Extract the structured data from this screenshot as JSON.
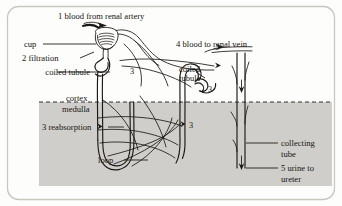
{
  "figure": {
    "frame_color": "#c9c7c2",
    "background_color": "#fdfdfc",
    "medulla_color": "#cfcecb",
    "ink_color": "#1c1915"
  },
  "labels": {
    "blood_from_renal_artery": "1 blood from renal artery",
    "blood_to_renal_vein": "4 blood to renal vein",
    "cup": "cup",
    "filtration": "2 filtration",
    "coiled_tubule_left": "coiled tubule",
    "coiled_tubule_right_line1": "coiled",
    "coiled_tubule_right_line2": "tubule",
    "cortex": "cortex",
    "medulla": "medulla",
    "reabsorption": "3 reabsorption",
    "loop": "loop",
    "collecting_tube_line1": "collecting",
    "collecting_tube_line2": "tube",
    "urine_to_ureter_line1": "5 urine to",
    "urine_to_ureter_line2": "ureter",
    "marker_3_a": "3",
    "marker_3_b": "3",
    "marker_3_c": "3",
    "marker_3_d": "3"
  }
}
